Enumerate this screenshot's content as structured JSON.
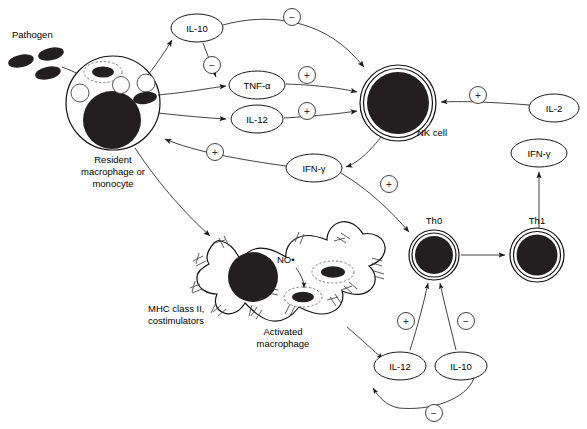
{
  "diagram": {
    "labels": {
      "pathogen": "Pathogen",
      "resident_macrophage_l1": "Resident",
      "resident_macrophage_l2": "macrophage or",
      "resident_macrophage_l3": "monocyte",
      "nk_cell": "NK cell",
      "th0": "Th0",
      "th1": "Th1",
      "activated_macrophage_l1": "Activated",
      "activated_macrophage_l2": "macrophage",
      "mhc_l1": "MHC class II,",
      "mhc_l2": "costimulators",
      "nitric_oxide": "NO•"
    },
    "mediators": [
      {
        "id": "il10-top",
        "label": "IL-10",
        "cx": 197,
        "cy": 28,
        "rx": 26,
        "ry": 14
      },
      {
        "id": "tnf-alpha",
        "label": "TNF-α",
        "cx": 257,
        "cy": 85,
        "rx": 28,
        "ry": 14
      },
      {
        "id": "il12-top",
        "label": "IL-12",
        "cx": 257,
        "cy": 119,
        "rx": 26,
        "ry": 14
      },
      {
        "id": "il2",
        "label": "IL-2",
        "cx": 554,
        "cy": 108,
        "rx": 25,
        "ry": 14
      },
      {
        "id": "ifn-gamma-mid",
        "label": "IFN-γ",
        "cx": 314,
        "cy": 168,
        "rx": 28,
        "ry": 14
      },
      {
        "id": "ifn-gamma-th1",
        "label": "IFN-γ",
        "cx": 539,
        "cy": 153,
        "rx": 28,
        "ry": 14
      },
      {
        "id": "il12-bottom",
        "label": "IL-12",
        "cx": 400,
        "cy": 366,
        "rx": 26,
        "ry": 14
      },
      {
        "id": "il10-bottom",
        "label": "IL-10",
        "cx": 461,
        "cy": 366,
        "rx": 26,
        "ry": 14
      }
    ],
    "signs": [
      {
        "id": "sign-il10-inhibits-nk",
        "symbol": "−",
        "cx": 292,
        "cy": 17
      },
      {
        "id": "sign-il10-inhibits-tnf",
        "symbol": "−",
        "cx": 212,
        "cy": 65
      },
      {
        "id": "sign-tnf-activates-nk",
        "symbol": "+",
        "cx": 307,
        "cy": 75
      },
      {
        "id": "sign-il12-activates-nk",
        "symbol": "+",
        "cx": 307,
        "cy": 111
      },
      {
        "id": "sign-il2-activates-nk",
        "symbol": "+",
        "cx": 478,
        "cy": 95
      },
      {
        "id": "sign-ifng-activates-mac",
        "symbol": "+",
        "cx": 215,
        "cy": 152
      },
      {
        "id": "sign-ifng-activates-th0",
        "symbol": "+",
        "cx": 389,
        "cy": 184
      },
      {
        "id": "sign-il12-activates-th0",
        "symbol": "+",
        "cx": 406,
        "cy": 321
      },
      {
        "id": "sign-il10-inhibits-th0",
        "symbol": "−",
        "cx": 466,
        "cy": 321
      },
      {
        "id": "sign-il10-inhibits-il12",
        "symbol": "−",
        "cx": 434,
        "cy": 413
      }
    ],
    "cells": {
      "resident_macrophage": {
        "cx": 113,
        "cy": 103,
        "r": 47
      },
      "nk_cell": {
        "cx": 398,
        "cy": 103,
        "r": 38
      },
      "th0": {
        "cx": 434,
        "cy": 255,
        "r": 25
      },
      "th1": {
        "cx": 537,
        "cy": 255,
        "r": 27
      }
    },
    "pathogen_particles": [
      {
        "cx": 21,
        "cy": 61,
        "rx": 13,
        "ry": 6.5,
        "rot": -12
      },
      {
        "cx": 51,
        "cy": 55,
        "rx": 13,
        "ry": 6.5,
        "rot": -12
      },
      {
        "cx": 47,
        "cy": 73,
        "rx": 13,
        "ry": 6.5,
        "rot": -12
      }
    ],
    "colors": {
      "line": "#1a1a1a",
      "fill_dark": "#231f20",
      "background": "#ffffff",
      "sign_stroke": "#2b2b2b"
    }
  }
}
